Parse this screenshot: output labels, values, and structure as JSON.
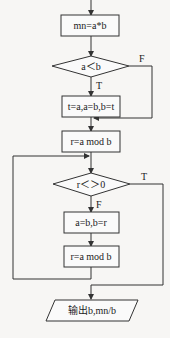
{
  "flowchart": {
    "nodes": {
      "mn_assign": "mn=a*b",
      "cond1": "a＜b",
      "swap": "t=a,a=b,b=t",
      "mod1": "r=a mod b",
      "cond2": "r＜＞0",
      "shift": "a=b,b=r",
      "mod2": "r=a mod b",
      "output": "输出b,mn/b"
    },
    "edge_labels": {
      "cond1_false": "F",
      "cond1_true": "T",
      "cond2_true": "T",
      "cond2_false": "F"
    }
  }
}
